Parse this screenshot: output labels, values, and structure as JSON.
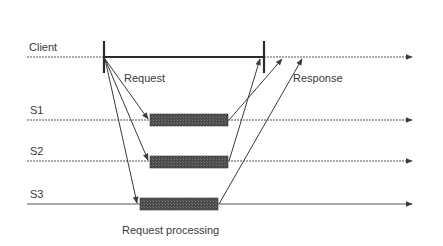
{
  "diagram": {
    "type": "sequence-timeline",
    "colors": {
      "line": "#4a4a4a",
      "bar": "#3c3c3c",
      "text": "#3a3a3a",
      "background": "#ffffff"
    },
    "lanes": [
      {
        "id": "client",
        "label": "Client",
        "y": 57
      },
      {
        "id": "s1",
        "label": "S1",
        "y": 120
      },
      {
        "id": "s2",
        "label": "S2",
        "y": 161
      },
      {
        "id": "s3",
        "label": "S3",
        "y": 204
      }
    ],
    "annotations": {
      "request": "Request",
      "response": "Response",
      "processing": "Request processing"
    },
    "client_interval": {
      "start_x": 104,
      "end_x": 264
    },
    "processing_bars": [
      {
        "lane": "s1",
        "x1": 150,
        "x2": 228
      },
      {
        "lane": "s2",
        "x1": 150,
        "x2": 228
      },
      {
        "lane": "s3",
        "x1": 140,
        "x2": 218
      }
    ],
    "request_arrows": [
      {
        "from": "client",
        "to": "s1"
      },
      {
        "from": "client",
        "to": "s2"
      },
      {
        "from": "client",
        "to": "s3"
      }
    ],
    "response_arrows": [
      {
        "from": "s1",
        "to": "client"
      },
      {
        "from": "s2",
        "to": "client"
      },
      {
        "from": "s3",
        "to": "client"
      }
    ]
  }
}
